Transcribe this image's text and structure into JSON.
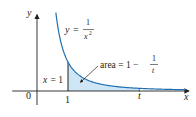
{
  "figure": {
    "curve_label": {
      "lhs": "y",
      "eq": "=",
      "num": "1",
      "den": "x",
      "exp": "2"
    },
    "line_label": "x = 1",
    "area_label": {
      "prefix": "area = 1 −",
      "num": "1",
      "den": "t"
    },
    "axis_labels": {
      "x": "x",
      "y": "y",
      "origin": "0",
      "one": "1",
      "t": "t"
    },
    "colors": {
      "curve": "#1f6fb2",
      "fill": "#cfe6f7",
      "axis": "#231f20",
      "text": "#231f20"
    }
  },
  "chart_data": {
    "type": "area",
    "title": "",
    "function": "y = 1/x^2",
    "shaded_region": {
      "from": 1,
      "to": "t",
      "area": "1 - 1/t"
    },
    "x_ticks": [
      "0",
      "1",
      "t"
    ],
    "xlabel": "x",
    "ylabel": "y",
    "xlim": [
      -0.8,
      4.9
    ],
    "ylim": [
      0,
      2.7
    ],
    "t_value": 3.3,
    "grid": false
  }
}
